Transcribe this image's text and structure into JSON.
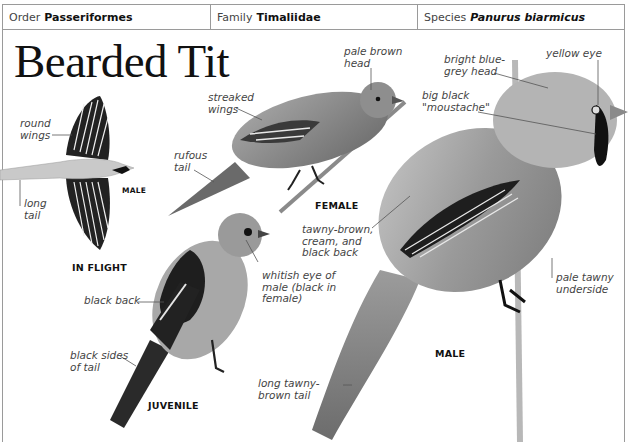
{
  "header": {
    "order": {
      "label": "Order",
      "value": "Passeriformes"
    },
    "family": {
      "label": "Family",
      "value": "Timaliidae"
    },
    "species": {
      "label": "Species",
      "value": "Panurus biarmicus"
    }
  },
  "title": "Bearded Tit",
  "illustrations": [
    {
      "caption": "IN FLIGHT",
      "sub_caption": "MALE",
      "annotations": [
        "round\nwings",
        "long\ntail"
      ]
    },
    {
      "caption": "FEMALE",
      "annotations": [
        "pale brown\nhead",
        "streaked\nwings",
        "rufous\ntail"
      ]
    },
    {
      "caption": "JUVENILE",
      "annotations": [
        "whitish eye of\nmale (black in\nfemale)",
        "black back",
        "black sides\nof tail"
      ]
    },
    {
      "caption": "MALE",
      "annotations": [
        "bright blue-\ngrey head",
        "yellow eye",
        "big black\n\"moustache\"",
        "tawny-brown,\ncream, and\nblack back",
        "pale tawny\nunderside",
        "long tawny-\nbrown tail"
      ]
    }
  ],
  "colors": {
    "border": "#9a9a9a",
    "text": "#222222",
    "label": "#444444"
  }
}
